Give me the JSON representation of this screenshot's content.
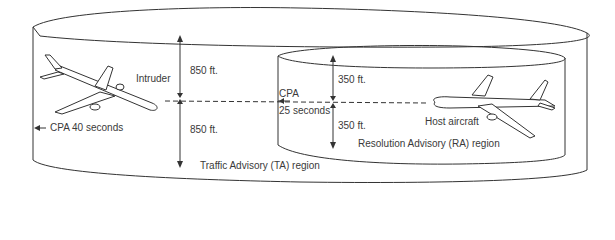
{
  "diagram": {
    "labels": {
      "intruder": "Intruder",
      "ta_upper": "850 ft.",
      "ta_lower": "850 ft.",
      "cpa_40": "CPA 40 seconds",
      "cpa": "CPA",
      "cpa_25": "25 seconds",
      "ra_upper": "350 ft.",
      "ra_lower": "350 ft.",
      "host": "Host aircraft",
      "ra_region": "Resolution Advisory (RA) region",
      "ta_region": "Traffic Advisory (TA) region"
    },
    "colors": {
      "line": "#333333",
      "text": "#3a3a3a"
    }
  }
}
